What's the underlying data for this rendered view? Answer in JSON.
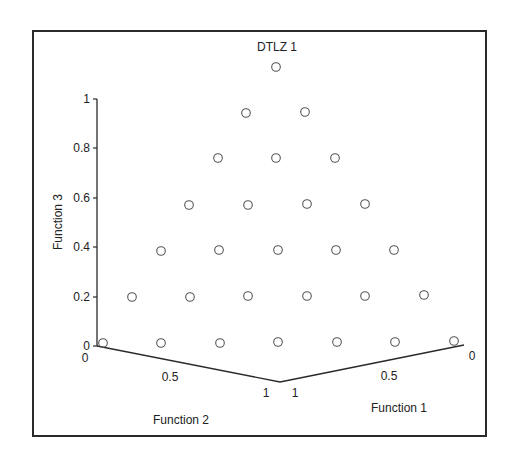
{
  "chart_data": {
    "type": "scatter",
    "subtype": "3d-scatter",
    "title": "DTLZ 1",
    "axes": {
      "x": {
        "label": "Function 1",
        "ticks": [
          "1",
          "0.5",
          "0"
        ],
        "range": [
          0,
          1
        ]
      },
      "y": {
        "label": "Function 2",
        "ticks": [
          "0",
          "0.5",
          "1"
        ],
        "range": [
          0,
          1
        ]
      },
      "z": {
        "label": "Function 3",
        "ticks": [
          "0",
          "0.2",
          "0.4",
          "0.6",
          "0.8",
          "1"
        ],
        "range": [
          0,
          1
        ]
      }
    },
    "marker": "open-circle",
    "grid": false,
    "legend": null,
    "series": [
      {
        "name": "Pareto front points",
        "note": "28 points on triangular lattice (f1+f2+f3 constant), 7 rows",
        "points": [
          {
            "f1": 0.0,
            "f2": 0.0,
            "f3": 0.5
          },
          {
            "f1": 0.0,
            "f2": 0.0833,
            "f3": 0.4167
          },
          {
            "f1": 0.0833,
            "f2": 0.0,
            "f3": 0.4167
          },
          {
            "f1": 0.0,
            "f2": 0.1667,
            "f3": 0.3333
          },
          {
            "f1": 0.0833,
            "f2": 0.0833,
            "f3": 0.3333
          },
          {
            "f1": 0.1667,
            "f2": 0.0,
            "f3": 0.3333
          },
          {
            "f1": 0.0,
            "f2": 0.25,
            "f3": 0.25
          },
          {
            "f1": 0.0833,
            "f2": 0.1667,
            "f3": 0.25
          },
          {
            "f1": 0.1667,
            "f2": 0.0833,
            "f3": 0.25
          },
          {
            "f1": 0.25,
            "f2": 0.0,
            "f3": 0.25
          },
          {
            "f1": 0.0,
            "f2": 0.3333,
            "f3": 0.1667
          },
          {
            "f1": 0.0833,
            "f2": 0.25,
            "f3": 0.1667
          },
          {
            "f1": 0.1667,
            "f2": 0.1667,
            "f3": 0.1667
          },
          {
            "f1": 0.25,
            "f2": 0.0833,
            "f3": 0.1667
          },
          {
            "f1": 0.3333,
            "f2": 0.0,
            "f3": 0.1667
          },
          {
            "f1": 0.0,
            "f2": 0.4167,
            "f3": 0.0833
          },
          {
            "f1": 0.0833,
            "f2": 0.3333,
            "f3": 0.0833
          },
          {
            "f1": 0.1667,
            "f2": 0.25,
            "f3": 0.0833
          },
          {
            "f1": 0.25,
            "f2": 0.1667,
            "f3": 0.0833
          },
          {
            "f1": 0.3333,
            "f2": 0.0833,
            "f3": 0.0833
          },
          {
            "f1": 0.4167,
            "f2": 0.0,
            "f3": 0.0833
          },
          {
            "f1": 0.0,
            "f2": 0.5,
            "f3": 0.0
          },
          {
            "f1": 0.0833,
            "f2": 0.4167,
            "f3": 0.0
          },
          {
            "f1": 0.1667,
            "f2": 0.3333,
            "f3": 0.0
          },
          {
            "f1": 0.25,
            "f2": 0.25,
            "f3": 0.0
          },
          {
            "f1": 0.3333,
            "f2": 0.1667,
            "f3": 0.0
          },
          {
            "f1": 0.4167,
            "f2": 0.0833,
            "f3": 0.0
          },
          {
            "f1": 0.5,
            "f2": 0.0,
            "f3": 0.0
          }
        ]
      }
    ]
  },
  "plot": {
    "frame": {
      "x": 33,
      "y": 31,
      "w": 453,
      "h": 405
    },
    "title_pos": {
      "x": 277,
      "y": 51
    },
    "z_axis": {
      "x": 97,
      "y_top": 99,
      "y_bottom": 346
    },
    "z_ticks": [
      {
        "label": "0",
        "y": 346
      },
      {
        "label": "0.2",
        "y": 297
      },
      {
        "label": "0.4",
        "y": 247
      },
      {
        "label": "0.6",
        "y": 198
      },
      {
        "label": "0.8",
        "y": 148
      },
      {
        "label": "1",
        "y": 99
      }
    ],
    "left_axis": {
      "x1": 97,
      "y1": 346,
      "x2": 280,
      "y2": 382
    },
    "right_axis": {
      "x1": 280,
      "y1": 382,
      "x2": 464,
      "y2": 345
    },
    "left_ticks": [
      {
        "label": "0",
        "x": 85,
        "y": 362
      },
      {
        "label": "0.5",
        "x": 170,
        "y": 381
      },
      {
        "label": "1",
        "x": 266,
        "y": 397
      }
    ],
    "right_ticks": [
      {
        "label": "1",
        "x": 295,
        "y": 397
      },
      {
        "label": "0.5",
        "x": 389,
        "y": 380
      },
      {
        "label": "0",
        "x": 472,
        "y": 360
      }
    ],
    "label_f3": {
      "x": 62,
      "y": 222
    },
    "label_f2": {
      "x": 181,
      "y": 424
    },
    "label_f1": {
      "x": 399,
      "y": 412
    },
    "points_px": [
      [
        276,
        67
      ],
      [
        246,
        113
      ],
      [
        305,
        112
      ],
      [
        218,
        158
      ],
      [
        276,
        158
      ],
      [
        335,
        158
      ],
      [
        189,
        205
      ],
      [
        248,
        205
      ],
      [
        307,
        204
      ],
      [
        365,
        204
      ],
      [
        161,
        251
      ],
      [
        219,
        250
      ],
      [
        278,
        250
      ],
      [
        336,
        250
      ],
      [
        394,
        250
      ],
      [
        132,
        297
      ],
      [
        190,
        297
      ],
      [
        248,
        296
      ],
      [
        307,
        296
      ],
      [
        365,
        296
      ],
      [
        424,
        295
      ],
      [
        103,
        343
      ],
      [
        161,
        343
      ],
      [
        220,
        343
      ],
      [
        278,
        342
      ],
      [
        337,
        342
      ],
      [
        395,
        342
      ],
      [
        454,
        341
      ]
    ],
    "point_radius": 4.3,
    "colors": {
      "frame": "#2a2a2a",
      "axis": "#2a2a2a",
      "marker": "#555555",
      "text": "#222222"
    }
  }
}
